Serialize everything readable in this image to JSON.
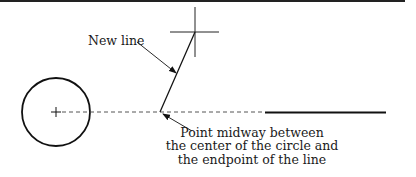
{
  "diagram": {
    "labels": {
      "new_line": "New line",
      "midpoint_line1": "Point midway between",
      "midpoint_line2": "the center of the circle and",
      "midpoint_line3": "the endpoint of the line"
    },
    "elements": {
      "top_border": {
        "x1": 0,
        "y1": 1,
        "x2": 405,
        "y2": 1
      },
      "circle": {
        "cx": 56,
        "cy": 112,
        "r": 34
      },
      "center_mark": {
        "cx": 56,
        "cy": 112,
        "size": 5
      },
      "dashed_line": {
        "x1": 61,
        "y1": 112,
        "x2": 265,
        "y2": 112
      },
      "existing_line": {
        "x1": 265,
        "y1": 112,
        "x2": 386,
        "y2": 112
      },
      "new_line": {
        "x1": 160,
        "y1": 112,
        "x2": 195,
        "y2": 32
      },
      "crosshair": {
        "cx": 195,
        "cy": 32,
        "h_half": 24,
        "v_half": 25
      }
    },
    "colors": {
      "stroke": "#111111",
      "dash": "#555555",
      "text": "#1a1a1a"
    }
  }
}
